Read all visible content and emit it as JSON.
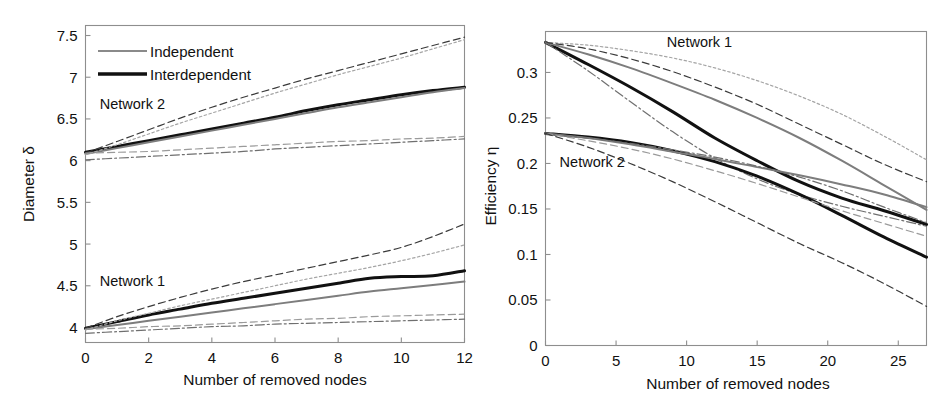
{
  "figure": {
    "background_color": "#ffffff",
    "panel_count": 2
  },
  "chart_data": [
    {
      "type": "line",
      "panel": "left",
      "title": "",
      "xlabel": "Number of removed nodes",
      "ylabel": "Diameter δ",
      "xlim": [
        0,
        12
      ],
      "ylim": [
        3.82,
        7.62
      ],
      "xticks": [
        0,
        2,
        4,
        6,
        8,
        10,
        12
      ],
      "xticklabels": [
        "0",
        "2",
        "4",
        "6",
        "8",
        "10",
        "12"
      ],
      "yticks": [
        4,
        4.5,
        5,
        5.5,
        6,
        6.5,
        7,
        7.5
      ],
      "yticklabels": [
        "4",
        "4.5",
        "5",
        "5.5",
        "6",
        "6.5",
        "7",
        "7.5"
      ],
      "grid": false,
      "legend": {
        "position": "top-left-inside",
        "entries": [
          {
            "label": "Independent",
            "style": "solid-thin-gray",
            "color": "#8a8a8a"
          },
          {
            "label": "Interdependent",
            "style": "solid-thick-black",
            "color": "#111111"
          }
        ]
      },
      "annotations": [
        {
          "text": "Network 2",
          "x": 0.45,
          "y": 6.62
        },
        {
          "text": "Network 1",
          "x": 0.45,
          "y": 4.5
        }
      ],
      "x": [
        0,
        1,
        2,
        3,
        4,
        5,
        6,
        7,
        8,
        9,
        10,
        11,
        12
      ],
      "series": [
        {
          "name": "Network 2 — Interdependent (mean)",
          "group": "Network 2",
          "style": "solid-thick-black",
          "values": [
            6.1,
            6.17,
            6.24,
            6.31,
            6.38,
            6.45,
            6.52,
            6.6,
            6.67,
            6.73,
            6.79,
            6.84,
            6.88
          ]
        },
        {
          "name": "Network 2 — Independent (mean)",
          "group": "Network 2",
          "style": "solid-thin-gray",
          "values": [
            6.08,
            6.15,
            6.22,
            6.29,
            6.36,
            6.43,
            6.5,
            6.57,
            6.64,
            6.7,
            6.76,
            6.82,
            6.87
          ]
        },
        {
          "name": "Network 2 — upper envelope A (dashed)",
          "group": "Network 2",
          "style": "dashed-dark",
          "values": [
            6.09,
            6.23,
            6.37,
            6.51,
            6.64,
            6.76,
            6.87,
            6.98,
            7.08,
            7.18,
            7.28,
            7.38,
            7.48
          ]
        },
        {
          "name": "Network 2 — upper envelope B (dotted)",
          "group": "Network 2",
          "style": "dotted-gray",
          "values": [
            6.07,
            6.19,
            6.32,
            6.45,
            6.57,
            6.69,
            6.81,
            6.92,
            7.03,
            7.13,
            7.23,
            7.34,
            7.45
          ]
        },
        {
          "name": "Network 2 — lower envelope A (dashed)",
          "group": "Network 2",
          "style": "dashed-gray",
          "values": [
            6.09,
            6.1,
            6.11,
            6.13,
            6.15,
            6.17,
            6.19,
            6.21,
            6.23,
            6.24,
            6.26,
            6.27,
            6.29
          ]
        },
        {
          "name": "Network 2 — lower envelope B (dash-dot)",
          "group": "Network 2",
          "style": "dash-dot",
          "values": [
            6.01,
            6.03,
            6.05,
            6.07,
            6.09,
            6.11,
            6.14,
            6.16,
            6.18,
            6.2,
            6.22,
            6.24,
            6.26
          ]
        },
        {
          "name": "Network 1 — Interdependent (mean)",
          "group": "Network 1",
          "style": "solid-thick-black",
          "values": [
            3.99,
            4.07,
            4.15,
            4.22,
            4.29,
            4.35,
            4.41,
            4.47,
            4.53,
            4.59,
            4.61,
            4.62,
            4.68
          ]
        },
        {
          "name": "Network 1 — Independent (mean)",
          "group": "Network 1",
          "style": "solid-thin-gray",
          "values": [
            3.98,
            4.03,
            4.08,
            4.13,
            4.18,
            4.23,
            4.28,
            4.33,
            4.38,
            4.43,
            4.47,
            4.51,
            4.55
          ]
        },
        {
          "name": "Network 1 — upper envelope A (dashed)",
          "group": "Network 1",
          "style": "dashed-dark",
          "values": [
            3.99,
            4.13,
            4.25,
            4.36,
            4.46,
            4.55,
            4.63,
            4.71,
            4.79,
            4.87,
            4.96,
            5.09,
            5.24
          ]
        },
        {
          "name": "Network 1 — upper envelope B (dotted)",
          "group": "Network 1",
          "style": "dotted-gray",
          "values": [
            3.97,
            4.08,
            4.17,
            4.26,
            4.34,
            4.42,
            4.5,
            4.58,
            4.65,
            4.72,
            4.8,
            4.89,
            4.99
          ]
        },
        {
          "name": "Network 1 — lower envelope A (dashed)",
          "group": "Network 1",
          "style": "dashed-gray",
          "values": [
            3.98,
            3.99,
            4.01,
            4.02,
            4.04,
            4.06,
            4.08,
            4.1,
            4.11,
            4.13,
            4.14,
            4.15,
            4.16
          ]
        },
        {
          "name": "Network 1 — lower envelope B (dash-dot)",
          "group": "Network 1",
          "style": "dash-dot",
          "values": [
            3.93,
            3.95,
            3.97,
            3.99,
            4.01,
            4.02,
            4.04,
            4.05,
            4.06,
            4.07,
            4.08,
            4.09,
            4.1
          ]
        }
      ]
    },
    {
      "type": "line",
      "panel": "right",
      "title": "",
      "xlabel": "Number of removed nodes",
      "ylabel": "Efficiency η",
      "xlim": [
        0,
        27
      ],
      "ylim": [
        0,
        0.345
      ],
      "xticks": [
        0,
        5,
        10,
        15,
        20,
        25
      ],
      "xticklabels": [
        "0",
        "5",
        "10",
        "15",
        "20",
        "25"
      ],
      "yticks": [
        0,
        0.05,
        0.1,
        0.15,
        0.2,
        0.25,
        0.3
      ],
      "yticklabels": [
        "0",
        "0.05",
        "0.1",
        "0.15",
        "0.2",
        "0.25",
        "0.3"
      ],
      "grid": false,
      "legend": {
        "position": "none",
        "entries": []
      },
      "annotations": [
        {
          "text": "Network 1",
          "x": 8.6,
          "y": 0.328
        },
        {
          "text": "Network 2",
          "x": 1.0,
          "y": 0.196
        }
      ],
      "x": [
        0,
        3,
        6,
        9,
        12,
        15,
        18,
        21,
        24,
        27
      ],
      "series": [
        {
          "name": "Network 1 — Interdependent (mean)",
          "group": "Network 1",
          "style": "solid-thick-black",
          "values": [
            0.333,
            0.309,
            0.284,
            0.257,
            0.228,
            0.203,
            0.18,
            0.162,
            0.148,
            0.133
          ]
        },
        {
          "name": "Network 1 — Independent (mean)",
          "group": "Network 1",
          "style": "solid-thin-gray",
          "values": [
            0.333,
            0.32,
            0.305,
            0.288,
            0.27,
            0.25,
            0.228,
            0.203,
            0.176,
            0.149
          ]
        },
        {
          "name": "Network 1 — upper envelope (dotted)",
          "group": "Network 1",
          "style": "dotted-gray",
          "values": [
            0.333,
            0.33,
            0.324,
            0.316,
            0.305,
            0.291,
            0.274,
            0.254,
            0.23,
            0.204
          ]
        },
        {
          "name": "Network 1 — mid envelope (dashed)",
          "group": "Network 1",
          "style": "dashed-dark",
          "values": [
            0.333,
            0.326,
            0.315,
            0.301,
            0.284,
            0.265,
            0.243,
            0.221,
            0.199,
            0.18
          ]
        },
        {
          "name": "Network 1 — lower envelope (dash-dot)",
          "group": "Network 1",
          "style": "dash-dot",
          "values": [
            0.333,
            0.302,
            0.268,
            0.235,
            0.206,
            0.183,
            0.166,
            0.153,
            0.142,
            0.131
          ]
        },
        {
          "name": "Network 2 — Interdependent (mean)",
          "group": "Network 2",
          "style": "solid-thick-black",
          "values": [
            0.233,
            0.229,
            0.223,
            0.214,
            0.202,
            0.186,
            0.166,
            0.143,
            0.119,
            0.097
          ]
        },
        {
          "name": "Network 2 — Independent (mean)",
          "group": "Network 2",
          "style": "solid-thin-gray",
          "values": [
            0.233,
            0.228,
            0.221,
            0.213,
            0.205,
            0.196,
            0.187,
            0.177,
            0.166,
            0.152
          ]
        },
        {
          "name": "Network 2 — upper envelope (dash-dot)",
          "group": "Network 2",
          "style": "dash-dot",
          "values": [
            0.233,
            0.228,
            0.222,
            0.215,
            0.207,
            0.197,
            0.185,
            0.17,
            0.152,
            0.135
          ]
        },
        {
          "name": "Network 2 — mid envelope (dashed)",
          "group": "Network 2",
          "style": "dashed-gray",
          "values": [
            0.233,
            0.225,
            0.216,
            0.205,
            0.192,
            0.178,
            0.163,
            0.148,
            0.134,
            0.12
          ]
        },
        {
          "name": "Network 2 — lower envelope (dashed long)",
          "group": "Network 2",
          "style": "dashed-dark",
          "values": [
            0.233,
            0.218,
            0.2,
            0.18,
            0.158,
            0.135,
            0.112,
            0.091,
            0.068,
            0.043
          ]
        }
      ]
    }
  ]
}
